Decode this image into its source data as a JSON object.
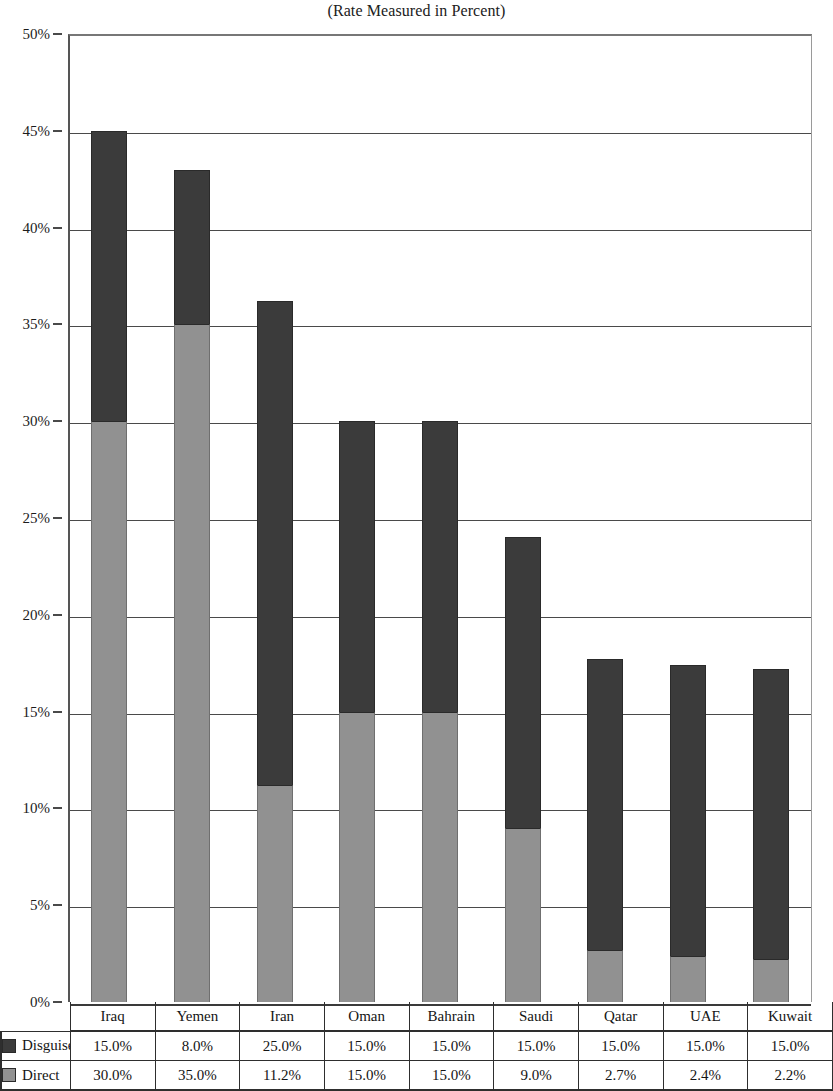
{
  "chart_data": {
    "type": "bar",
    "subtype": "stacked-vertical-bar",
    "title": "(Rate Measured in Percent)",
    "xlabel": "",
    "ylabel": "",
    "ylim": [
      0,
      50
    ],
    "ytick_labels": [
      "0%",
      "5%",
      "10%",
      "15%",
      "20%",
      "25%",
      "30%",
      "35%",
      "40%",
      "45%",
      "50%"
    ],
    "ytick_values": [
      0,
      5,
      10,
      15,
      20,
      25,
      30,
      35,
      40,
      45,
      50
    ],
    "grid": true,
    "legend_position": "table-row-labels",
    "categories": [
      "Iraq",
      "Yemen",
      "Iran",
      "Oman",
      "Bahrain",
      "Saudi",
      "Qatar",
      "UAE",
      "Kuwait"
    ],
    "series": [
      {
        "name": "Disguised",
        "color": "#3b3b3b",
        "values": [
          15.0,
          8.0,
          25.0,
          15.0,
          15.0,
          15.0,
          15.0,
          15.0,
          15.0
        ],
        "labels": [
          "15.0%",
          "8.0%",
          "25.0%",
          "15.0%",
          "15.0%",
          "15.0%",
          "15.0%",
          "15.0%",
          "15.0%"
        ]
      },
      {
        "name": "Direct",
        "color": "#919191",
        "values": [
          30.0,
          35.0,
          11.2,
          15.0,
          15.0,
          9.0,
          2.7,
          2.4,
          2.2
        ],
        "labels": [
          "30.0%",
          "35.0%",
          "11.2%",
          "15.0%",
          "15.0%",
          "9.0%",
          "2.7%",
          "2.4%",
          "2.2%"
        ]
      }
    ],
    "totals": [
      45.0,
      43.0,
      36.2,
      30.0,
      30.0,
      24.0,
      17.7,
      17.4,
      17.2
    ]
  },
  "table": {
    "row_label_disguised": "Disguised",
    "row_label_direct": "Direct"
  },
  "legend": {
    "disguised_swatch": "dark-gray-square-icon",
    "direct_swatch": "light-gray-square-icon"
  }
}
